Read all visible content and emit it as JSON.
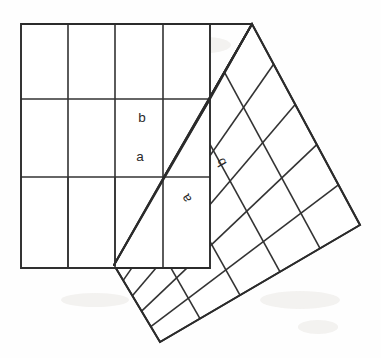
{
  "figure": {
    "background_color": "#fefefe",
    "line_color": "#2b2b2b",
    "grid_line_color": "#333333",
    "label_color": "#2a2a2a"
  },
  "labels": {
    "upright_b": "b",
    "upright_a": "a",
    "tilted_b": "b",
    "tilted_a": "a"
  },
  "geometry": {
    "upright_square": {
      "top_left": [
        21,
        24
      ],
      "top_right": [
        210,
        24
      ],
      "bottom_right": [
        210,
        268
      ],
      "bottom_left": [
        21,
        268
      ],
      "vertical_grid_x": [
        68,
        115,
        163
      ],
      "horizontal_grid_y": [
        99,
        177
      ]
    },
    "triangle": {
      "apex_top": [
        252,
        24
      ],
      "vertex_right": [
        164,
        177
      ],
      "vertex_bottom": [
        114,
        265
      ]
    },
    "tilted_square": {
      "corner_top": [
        252,
        24
      ],
      "corner_left": [
        114,
        265
      ],
      "corner_bottom": [
        160,
        342
      ],
      "corner_right": [
        360,
        225
      ]
    },
    "label_positions": {
      "upright_b": [
        142,
        118
      ],
      "upright_a": [
        140,
        157
      ],
      "tilted_b": [
        222,
        162
      ],
      "tilted_a": [
        187,
        198
      ]
    },
    "label_rotation_deg": {
      "upright_b": 0,
      "upright_a": 0,
      "tilted_b": -119,
      "tilted_a": -119
    }
  },
  "chart_data": {
    "type": "diagram",
    "elements": [
      {
        "name": "square-on-b",
        "shape": "square",
        "subdivisions": "5 x 5",
        "orientation": "axis-aligned",
        "label": "b"
      },
      {
        "name": "square-on-c",
        "shape": "square",
        "subdivisions": "5 x 5",
        "orientation": "tilted",
        "label": "b"
      },
      {
        "name": "right-triangle",
        "shape": "triangle",
        "legs": [
          "a",
          "b"
        ],
        "labels": [
          "a",
          "b"
        ]
      }
    ]
  }
}
